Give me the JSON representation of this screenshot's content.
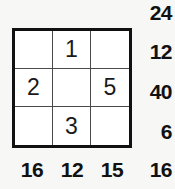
{
  "puzzle": {
    "type": "multiplication-grid",
    "rows": 3,
    "columns": 3,
    "grid": [
      [
        "",
        "1",
        ""
      ],
      [
        "2",
        "",
        "5"
      ],
      [
        "",
        "3",
        ""
      ]
    ],
    "row_products": [
      "12",
      "40",
      "6"
    ],
    "column_products": [
      "16",
      "12",
      "15"
    ],
    "diagonal_products": {
      "top_right": "24",
      "bottom_right": "16"
    },
    "colors": {
      "ink": "#111111",
      "grid_line": "#4a4a4a",
      "cell_background": "#ffffff",
      "page_background": "#f7f7f5"
    }
  }
}
